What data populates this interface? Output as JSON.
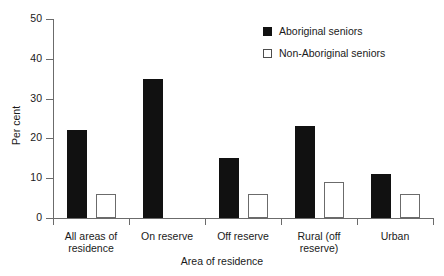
{
  "chart_data": {
    "type": "bar",
    "title": "",
    "subtitle": "",
    "xlabel": "Area of residence",
    "ylabel": "Per cent",
    "ylim": [
      0,
      50
    ],
    "yticks": [
      0,
      10,
      20,
      30,
      40,
      50
    ],
    "grid": false,
    "legend_position": "top-right",
    "categories": [
      "All areas of residence",
      "On reserve",
      "Off reserve",
      "Rural (off reserve)",
      "Urban"
    ],
    "category_lines": [
      [
        "All areas of",
        "residence"
      ],
      [
        "On reserve"
      ],
      [
        "Off reserve"
      ],
      [
        "Rural (off",
        "reserve)"
      ],
      [
        "Urban"
      ]
    ],
    "series": [
      {
        "name": "Aboriginal seniors",
        "color": "#111111",
        "values": [
          22,
          35,
          15,
          23,
          11
        ]
      },
      {
        "name": "Non-Aboriginal seniors",
        "color": "#ffffff",
        "values": [
          6,
          0,
          6,
          9,
          6
        ]
      }
    ]
  },
  "legend": {
    "items": [
      {
        "label": "Aboriginal seniors",
        "swatch": "filled-black-square"
      },
      {
        "label": "Non-Aboriginal seniors",
        "swatch": "outlined-white-square"
      }
    ]
  },
  "axes": {
    "y_title": "Per cent",
    "x_title": "Area of residence",
    "y_tick_labels": [
      "0",
      "10",
      "20",
      "30",
      "40",
      "50"
    ]
  }
}
